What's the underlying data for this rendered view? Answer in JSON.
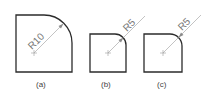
{
  "figures": [
    {
      "id": "a",
      "caption": "(a)",
      "radius_label": "R10"
    },
    {
      "id": "b",
      "caption": "(b)",
      "radius_label": "R5"
    },
    {
      "id": "c",
      "caption": "(c)",
      "radius_label": "R5"
    }
  ],
  "colors": {
    "outline": "#2b2b2b",
    "dimension": "#9a9a9a",
    "text": "#777777"
  }
}
